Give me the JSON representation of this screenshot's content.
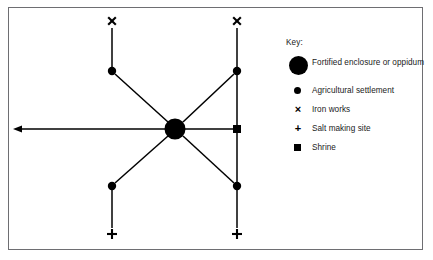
{
  "figure": {
    "type": "network-diagram"
  },
  "legend": {
    "title": "Key:",
    "entries": [
      {
        "symbol": "large-filled-circle",
        "label": "Fortified enclosure or oppidum"
      },
      {
        "symbol": "small-filled-circle",
        "label": "Agricultural settlement"
      },
      {
        "symbol": "cross-x",
        "glyph": "×",
        "label": "Iron works"
      },
      {
        "symbol": "plus",
        "glyph": "+",
        "label": "Salt making site"
      },
      {
        "symbol": "filled-square",
        "label": "Shrine"
      }
    ]
  },
  "diagram": {
    "nodes": [
      {
        "id": "oppidum",
        "kind": "fortified-enclosure",
        "x": 175,
        "y": 129,
        "r": 10.5
      },
      {
        "id": "settlement-top-left",
        "kind": "agricultural-settlement",
        "x": 112,
        "y": 71,
        "r": 4.2
      },
      {
        "id": "settlement-top-right",
        "kind": "agricultural-settlement",
        "x": 237,
        "y": 71,
        "r": 4.2
      },
      {
        "id": "settlement-bottom-left",
        "kind": "agricultural-settlement",
        "x": 112,
        "y": 186,
        "r": 4.2
      },
      {
        "id": "settlement-bottom-right",
        "kind": "agricultural-settlement",
        "x": 237,
        "y": 186,
        "r": 4.2
      },
      {
        "id": "ironworks-top-left",
        "kind": "iron-works",
        "glyph": "×",
        "x": 112,
        "y": 21
      },
      {
        "id": "ironworks-top-right",
        "kind": "iron-works",
        "glyph": "×",
        "x": 237,
        "y": 21
      },
      {
        "id": "salt-bottom-left",
        "kind": "salt-making-site",
        "glyph": "+",
        "x": 112,
        "y": 234
      },
      {
        "id": "salt-bottom-right",
        "kind": "salt-making-site",
        "glyph": "+",
        "x": 237,
        "y": 234
      },
      {
        "id": "shrine-right",
        "kind": "shrine",
        "x": 237,
        "y": 129,
        "size": 8
      }
    ],
    "links": [
      {
        "from": "settlement-top-left",
        "to": "oppidum",
        "style": "diagonal"
      },
      {
        "from": "settlement-top-right",
        "to": "oppidum",
        "style": "diagonal"
      },
      {
        "from": "settlement-bottom-left",
        "to": "oppidum",
        "style": "diagonal"
      },
      {
        "from": "settlement-bottom-right",
        "to": "oppidum",
        "style": "diagonal"
      },
      {
        "from": "ironworks-top-left",
        "to": "settlement-top-left",
        "style": "vertical"
      },
      {
        "from": "ironworks-top-right",
        "to": "settlement-top-right",
        "style": "vertical"
      },
      {
        "from": "settlement-bottom-left",
        "to": "salt-bottom-left",
        "style": "vertical"
      },
      {
        "from": "settlement-bottom-right",
        "to": "salt-bottom-right",
        "style": "vertical"
      },
      {
        "from": "settlement-top-right",
        "to": "shrine-right",
        "style": "vertical"
      },
      {
        "from": "shrine-right",
        "to": "settlement-bottom-right",
        "style": "vertical"
      },
      {
        "from": "shrine-right",
        "to": "oppidum",
        "style": "horizontal"
      },
      {
        "from": "external-left",
        "to": "oppidum",
        "style": "double-headed-arrow"
      }
    ]
  },
  "colors": {
    "ink": "#000000",
    "frame": "#6e6e72",
    "background": "#ffffff"
  }
}
